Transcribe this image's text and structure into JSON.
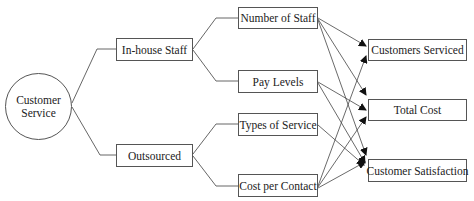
{
  "root": {
    "line1": "Customer",
    "line2": "Service"
  },
  "options": [
    {
      "id": "inhouse",
      "label": "In-house Staff"
    },
    {
      "id": "outsourced",
      "label": "Outsourced"
    }
  ],
  "factors": [
    {
      "id": "num_staff",
      "label": "Number of Staff",
      "parent": "inhouse"
    },
    {
      "id": "pay",
      "label": "Pay Levels",
      "parent": "inhouse"
    },
    {
      "id": "types",
      "label": "Types of Service",
      "parent": "outsourced"
    },
    {
      "id": "cost_contact",
      "label": "Cost per Contact",
      "parent": "outsourced"
    }
  ],
  "outcomes": [
    {
      "id": "serviced",
      "label": "Customers Serviced"
    },
    {
      "id": "total_cost",
      "label": "Total Cost"
    },
    {
      "id": "satisfaction",
      "label": "Customer Satisfaction"
    }
  ],
  "arrows": [
    {
      "from": "num_staff",
      "to": "serviced"
    },
    {
      "from": "num_staff",
      "to": "total_cost"
    },
    {
      "from": "num_staff",
      "to": "satisfaction"
    },
    {
      "from": "pay",
      "to": "total_cost"
    },
    {
      "from": "pay",
      "to": "satisfaction"
    },
    {
      "from": "types",
      "to": "satisfaction"
    },
    {
      "from": "cost_contact",
      "to": "serviced"
    },
    {
      "from": "cost_contact",
      "to": "total_cost"
    },
    {
      "from": "cost_contact",
      "to": "satisfaction"
    }
  ],
  "colors": {
    "line": "#555555",
    "arrowhead": "#111111"
  }
}
